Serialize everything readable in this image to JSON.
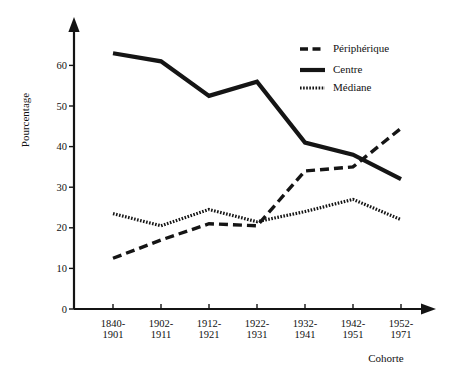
{
  "chart_data": {
    "type": "line",
    "title": "",
    "xlabel": "Cohorte",
    "ylabel": "Pourcentage",
    "categories": [
      "1840-1901",
      "1902-1911",
      "1912-1921",
      "1922-1931",
      "1932-1941",
      "1942-1951",
      "1952-1971"
    ],
    "category_lines": [
      [
        "1840-",
        "1901"
      ],
      [
        "1902-",
        "1911"
      ],
      [
        "1912-",
        "1921"
      ],
      [
        "1922-",
        "1931"
      ],
      [
        "1932-",
        "1941"
      ],
      [
        "1942-",
        "1951"
      ],
      [
        "1952-",
        "1971"
      ]
    ],
    "ylim": [
      0,
      66
    ],
    "yticks": [
      0,
      10,
      20,
      30,
      40,
      50,
      60
    ],
    "ytick_labels": [
      "0",
      "10",
      "20",
      "30",
      "40",
      "50",
      "60"
    ],
    "grid": false,
    "legend_position": "top-right",
    "series": [
      {
        "name": "Périphérique",
        "style": "dash-dot",
        "color": "#151515",
        "values": [
          12.5,
          17.0,
          21.0,
          20.5,
          34.0,
          35.0,
          44.5
        ]
      },
      {
        "name": "Centre",
        "style": "solid",
        "color": "#151515",
        "values": [
          63.0,
          61.0,
          52.5,
          56.0,
          41.0,
          38.0,
          32.0
        ]
      },
      {
        "name": "Médiane",
        "style": "dotted",
        "color": "#151515",
        "values": [
          23.5,
          20.5,
          24.5,
          21.5,
          24.0,
          27.0,
          22.0
        ]
      }
    ]
  },
  "legend": {
    "items": [
      {
        "label": "Périphérique"
      },
      {
        "label": "Centre"
      },
      {
        "label": "Médiane"
      }
    ]
  },
  "axes": {
    "y_title": "Pourcentage",
    "x_title": "Cohorte"
  }
}
